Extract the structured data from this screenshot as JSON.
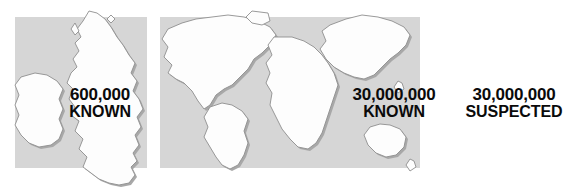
{
  "figure": {
    "type": "comparison-infographic",
    "background_color": "#ffffff",
    "panel_color": "#d6d6d6",
    "land_color": "#fdfdfd",
    "land_shadow_color": "#a8a8a8",
    "text_color": "#0a0a0a"
  },
  "panels": [
    {
      "id": "uk",
      "map_name": "british-isles-map",
      "labels": [
        {
          "id": "uk-known",
          "number": "600,000",
          "word": "KNOWN"
        }
      ]
    },
    {
      "id": "world",
      "map_name": "world-map",
      "labels": [
        {
          "id": "world-known",
          "number": "30,000,000",
          "word": "KNOWN"
        },
        {
          "id": "world-suspected",
          "number": "30,000,000",
          "word": "SUSPECTED"
        }
      ]
    }
  ]
}
